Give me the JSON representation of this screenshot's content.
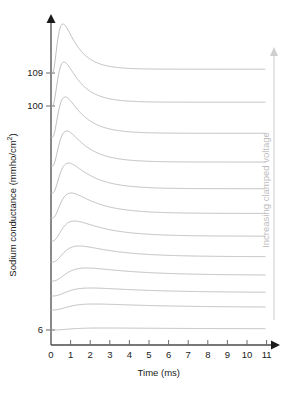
{
  "chart_data": {
    "type": "line",
    "title": "",
    "xlabel": "Time (ms)",
    "ylabel": "Sodium conductance (mmho/cm2)",
    "ylabel_display": "Sodium conductance (mmho/cm²)",
    "xlim": [
      0,
      11
    ],
    "xticks": [
      0,
      1,
      2,
      3,
      4,
      5,
      6,
      7,
      8,
      9,
      10,
      11
    ],
    "xticklabels": [
      "0",
      "1",
      "2",
      "3",
      "4",
      "5",
      "6",
      "7",
      "8",
      "9",
      "10",
      "11"
    ],
    "yticks": [
      109,
      100,
      6
    ],
    "yticklabels": [
      "109",
      "100",
      "6"
    ],
    "grid": false,
    "legend": false,
    "annotation": "Increasing clamped voltage",
    "annotation_position": "right-vertical-arrow-up",
    "series_count": 12,
    "series_note": "Stacked voltage-clamp sodium conductance traces, each offset vertically; clamped voltage increases upward.",
    "series": [
      {
        "name": "trace-109",
        "clamp_label": "109",
        "baseline": 73,
        "peak_time": 0.62,
        "peak_amp": 49,
        "rise_tau": 0.22,
        "decay_tau": 0.78,
        "plateau": 1.5
      },
      {
        "name": "trace-100",
        "clamp_label": "100",
        "baseline": 106,
        "peak_time": 0.66,
        "peak_amp": 44,
        "rise_tau": 0.24,
        "decay_tau": 0.85,
        "plateau": 1.5
      },
      {
        "name": "trace-3",
        "clamp_label": "",
        "baseline": 137,
        "peak_time": 0.72,
        "peak_amp": 40,
        "rise_tau": 0.26,
        "decay_tau": 0.95,
        "plateau": 1.5
      },
      {
        "name": "trace-4",
        "clamp_label": "",
        "baseline": 166,
        "peak_time": 0.8,
        "peak_amp": 35,
        "rise_tau": 0.29,
        "decay_tau": 1.05,
        "plateau": 1.6
      },
      {
        "name": "trace-5",
        "clamp_label": "",
        "baseline": 193,
        "peak_time": 0.9,
        "peak_amp": 30,
        "rise_tau": 0.32,
        "decay_tau": 1.2,
        "plateau": 1.8
      },
      {
        "name": "trace-6",
        "clamp_label": "",
        "baseline": 218,
        "peak_time": 1.02,
        "peak_amp": 25,
        "rise_tau": 0.36,
        "decay_tau": 1.4,
        "plateau": 2.0
      },
      {
        "name": "trace-7",
        "clamp_label": "",
        "baseline": 241,
        "peak_time": 1.18,
        "peak_amp": 20,
        "rise_tau": 0.41,
        "decay_tau": 1.65,
        "plateau": 2.2
      },
      {
        "name": "trace-8",
        "clamp_label": "",
        "baseline": 262,
        "peak_time": 1.38,
        "peak_amp": 16,
        "rise_tau": 0.47,
        "decay_tau": 2.0,
        "plateau": 2.6
      },
      {
        "name": "trace-9",
        "clamp_label": "",
        "baseline": 281,
        "peak_time": 1.62,
        "peak_amp": 13,
        "rise_tau": 0.55,
        "decay_tau": 2.6,
        "plateau": 3.2
      },
      {
        "name": "trace-10",
        "clamp_label": "",
        "baseline": 296,
        "peak_time": 1.8,
        "peak_amp": 8,
        "rise_tau": 0.6,
        "decay_tau": 3.2,
        "plateau": 2.0
      },
      {
        "name": "trace-11",
        "clamp_label": "",
        "baseline": 310,
        "peak_time": 1.9,
        "peak_amp": 6,
        "rise_tau": 0.64,
        "decay_tau": 3.6,
        "plateau": 1.6
      },
      {
        "name": "trace-6low",
        "clamp_label": "6",
        "baseline": 330,
        "peak_time": 2.1,
        "peak_amp": 2,
        "rise_tau": 0.7,
        "decay_tau": 4.5,
        "plateau": 0.8
      }
    ]
  },
  "axes": {
    "y_arrow": "up-arrow",
    "x_arrow": "right-arrow"
  },
  "colors": {
    "curve": "#b3b3b3",
    "axis": "#4a4a4a",
    "tick": "#6b6b6b",
    "text": "#1a1a1a",
    "annotation": "#bdbdbd"
  }
}
